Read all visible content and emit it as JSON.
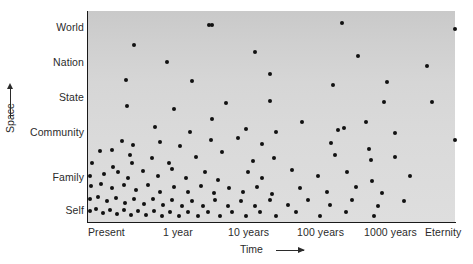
{
  "chart_data": {
    "type": "scatter",
    "title": "",
    "xlabel": "Time",
    "ylabel": "Space",
    "grid": false,
    "legend": null,
    "x_axis": {
      "label": "Time",
      "arrow": "right-arrow-icon",
      "ticks": [
        "Present",
        "1 year",
        "10 years",
        "100 years",
        "1000 years",
        "Eternity"
      ],
      "scale": "logarithmic",
      "tick_positions_px": [
        107,
        181,
        257,
        330,
        403,
        440
      ]
    },
    "y_axis": {
      "label": "Space",
      "arrow": "up-arrow-icon",
      "ticks": [
        "Self",
        "Family",
        "Community",
        "State",
        "Nation",
        "World"
      ],
      "scale": "ordinal",
      "tick_positions_px": [
        210,
        177,
        132,
        97,
        62,
        27
      ]
    },
    "plot_area_px": {
      "left": 88,
      "top": 11,
      "width": 367,
      "height": 211
    },
    "marker": {
      "shape": "circle",
      "color": "#111111",
      "size_px": 4
    },
    "plot_background_color": "#d6d6d6",
    "points": [
      [
        209,
        25
      ],
      [
        342,
        23
      ],
      [
        212,
        25
      ],
      [
        455,
        29
      ],
      [
        134,
        45
      ],
      [
        255,
        52
      ],
      [
        358,
        56
      ],
      [
        167,
        62
      ],
      [
        270,
        74
      ],
      [
        427,
        66
      ],
      [
        126,
        80
      ],
      [
        192,
        81
      ],
      [
        333,
        85
      ],
      [
        387,
        82
      ],
      [
        127,
        106
      ],
      [
        174,
        109
      ],
      [
        226,
        103
      ],
      [
        270,
        101
      ],
      [
        384,
        102
      ],
      [
        432,
        102
      ],
      [
        302,
        122
      ],
      [
        155,
        127
      ],
      [
        212,
        119
      ],
      [
        122,
        141
      ],
      [
        133,
        145
      ],
      [
        190,
        132
      ],
      [
        246,
        129
      ],
      [
        276,
        132
      ],
      [
        338,
        130
      ],
      [
        344,
        128
      ],
      [
        366,
        122
      ],
      [
        395,
        133
      ],
      [
        100,
        151
      ],
      [
        130,
        155
      ],
      [
        132,
        163
      ],
      [
        112,
        150
      ],
      [
        160,
        142
      ],
      [
        180,
        146
      ],
      [
        211,
        140
      ],
      [
        238,
        138
      ],
      [
        262,
        144
      ],
      [
        331,
        143
      ],
      [
        369,
        149
      ],
      [
        455,
        140
      ],
      [
        92,
        163
      ],
      [
        113,
        167
      ],
      [
        152,
        158
      ],
      [
        169,
        163
      ],
      [
        196,
        157
      ],
      [
        222,
        152
      ],
      [
        253,
        161
      ],
      [
        274,
        158
      ],
      [
        335,
        155
      ],
      [
        371,
        160
      ],
      [
        395,
        157
      ],
      [
        90,
        176
      ],
      [
        104,
        174
      ],
      [
        118,
        172
      ],
      [
        128,
        178
      ],
      [
        143,
        171
      ],
      [
        158,
        176
      ],
      [
        172,
        169
      ],
      [
        186,
        178
      ],
      [
        205,
        172
      ],
      [
        218,
        180
      ],
      [
        248,
        172
      ],
      [
        262,
        178
      ],
      [
        292,
        170
      ],
      [
        318,
        176
      ],
      [
        347,
        172
      ],
      [
        372,
        181
      ],
      [
        410,
        176
      ],
      [
        91,
        186
      ],
      [
        101,
        184
      ],
      [
        112,
        188
      ],
      [
        124,
        185
      ],
      [
        136,
        190
      ],
      [
        148,
        185
      ],
      [
        160,
        192
      ],
      [
        174,
        187
      ],
      [
        188,
        192
      ],
      [
        201,
        186
      ],
      [
        214,
        193
      ],
      [
        229,
        188
      ],
      [
        243,
        192
      ],
      [
        257,
        187
      ],
      [
        272,
        194
      ],
      [
        300,
        188
      ],
      [
        327,
        192
      ],
      [
        356,
        187
      ],
      [
        382,
        193
      ],
      [
        90,
        199
      ],
      [
        98,
        197
      ],
      [
        107,
        201
      ],
      [
        116,
        198
      ],
      [
        125,
        203
      ],
      [
        134,
        199
      ],
      [
        144,
        204
      ],
      [
        153,
        199
      ],
      [
        163,
        205
      ],
      [
        172,
        200
      ],
      [
        182,
        206
      ],
      [
        192,
        201
      ],
      [
        203,
        206
      ],
      [
        215,
        200
      ],
      [
        228,
        206
      ],
      [
        241,
        201
      ],
      [
        255,
        206
      ],
      [
        270,
        200
      ],
      [
        288,
        205
      ],
      [
        308,
        200
      ],
      [
        330,
        205
      ],
      [
        352,
        200
      ],
      [
        378,
        206
      ],
      [
        404,
        201
      ],
      [
        90,
        211
      ],
      [
        96,
        209
      ],
      [
        103,
        213
      ],
      [
        110,
        210
      ],
      [
        117,
        214
      ],
      [
        124,
        210
      ],
      [
        131,
        215
      ],
      [
        138,
        211
      ],
      [
        146,
        215
      ],
      [
        154,
        211
      ],
      [
        162,
        216
      ],
      [
        170,
        212
      ],
      [
        179,
        216
      ],
      [
        188,
        212
      ],
      [
        198,
        216
      ],
      [
        208,
        212
      ],
      [
        220,
        216
      ],
      [
        232,
        212
      ],
      [
        246,
        216
      ],
      [
        260,
        212
      ],
      [
        276,
        216
      ],
      [
        296,
        212
      ],
      [
        320,
        216
      ],
      [
        346,
        212
      ],
      [
        374,
        216
      ]
    ]
  },
  "y_axis_labels": [
    {
      "text": "World",
      "top": 21
    },
    {
      "text": "Nation",
      "top": 56
    },
    {
      "text": "State",
      "top": 91
    },
    {
      "text": "Community",
      "top": 126
    },
    {
      "text": "Family",
      "top": 171
    },
    {
      "text": "Self",
      "top": 204
    }
  ],
  "x_axis_labels": [
    {
      "text": "Present",
      "left": 88
    },
    {
      "text": "1 year",
      "left": 163
    },
    {
      "text": "10 years",
      "left": 228
    },
    {
      "text": "100 years",
      "left": 297
    },
    {
      "text": "1000 years",
      "left": 364
    },
    {
      "text": "Eternity",
      "left": 425
    }
  ],
  "axis_titles": {
    "space": "Space",
    "time": "Time"
  }
}
